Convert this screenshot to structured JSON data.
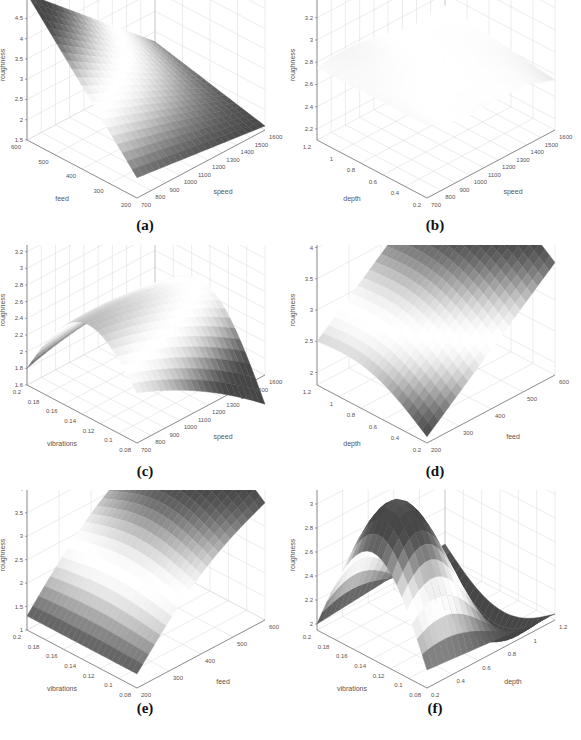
{
  "chart_data": [
    {
      "id": "a",
      "type": "surface3d",
      "caption": "(a)",
      "xlabel": "speed",
      "ylabel": "feed",
      "zlabel": "roughness",
      "x_ticks": [
        "700",
        "800",
        "900",
        "1000",
        "1100",
        "1200",
        "1300",
        "1400",
        "1500",
        "1600"
      ],
      "y_ticks": [
        "200",
        "300",
        "400",
        "500",
        "600"
      ],
      "z_ticks": [
        "1.5",
        "2",
        "2.5",
        "3",
        "3.5",
        "4",
        "4.5",
        "5"
      ],
      "xlim": [
        700,
        1600
      ],
      "ylim": [
        200,
        600
      ],
      "zlim": [
        1.5,
        5.2
      ],
      "grid": true,
      "surface_description": "Monotonic plane-like surface; max ~5.1 at speed 700/feed 600, min ~1.6 at speed 1600/feed 200",
      "corner_values": {
        "x_min_y_min": 2.0,
        "x_max_y_min": 1.6,
        "x_min_y_max": 5.1,
        "x_max_y_max": 2.6
      }
    },
    {
      "id": "b",
      "type": "surface3d",
      "caption": "(b)",
      "xlabel": "speed",
      "ylabel": "depth",
      "zlabel": "roughness",
      "x_ticks": [
        "700",
        "800",
        "900",
        "1000",
        "1100",
        "1200",
        "1300",
        "1400",
        "1500",
        "1600"
      ],
      "y_ticks": [
        "0.2",
        "0.4",
        "0.6",
        "0.8",
        "1",
        "1.2"
      ],
      "z_ticks": [
        "2.2",
        "2.4",
        "2.6",
        "2.8",
        "3",
        "3.2",
        "3.4"
      ],
      "xlim": [
        700,
        1600
      ],
      "ylim": [
        0.2,
        1.2
      ],
      "zlim": [
        2.1,
        3.45
      ],
      "grid": true,
      "surface_description": "Nearly flat, thin twisted surface around roughness 2.6–2.8",
      "corner_values": {
        "x_min_y_min": 2.75,
        "x_max_y_min": 2.55,
        "x_min_y_max": 2.75,
        "x_max_y_max": 2.7
      }
    },
    {
      "id": "c",
      "type": "surface3d",
      "caption": "(c)",
      "xlabel": "speed",
      "ylabel": "vibrations",
      "zlabel": "roughness",
      "x_ticks": [
        "700",
        "800",
        "900",
        "1000",
        "1100",
        "1200",
        "1300",
        "1400",
        "1500",
        "1600"
      ],
      "y_ticks": [
        "0.08",
        "0.1",
        "0.12",
        "0.14",
        "0.16",
        "0.18",
        "0.2"
      ],
      "z_ticks": [
        "1.6",
        "1.8",
        "2",
        "2.2",
        "2.4",
        "2.6",
        "2.8",
        "3",
        "3.2",
        "3.4"
      ],
      "xlim": [
        700,
        1600
      ],
      "ylim": [
        0.08,
        0.2
      ],
      "zlim": [
        1.6,
        3.4
      ],
      "grid": true,
      "surface_description": "Ridge along the vibrations direction peaking ~2.6 at mid vibrations; drops toward ~1.6 at high speed",
      "corner_values": {
        "x_min_y_min": 2.2,
        "x_max_y_min": 1.6,
        "x_min_y_max": 1.8,
        "x_max_y_max": 2.3
      }
    },
    {
      "id": "d",
      "type": "surface3d",
      "caption": "(d)",
      "xlabel": "feed",
      "ylabel": "depth",
      "zlabel": "roughness",
      "x_ticks": [
        "200",
        "300",
        "400",
        "500",
        "600"
      ],
      "y_ticks": [
        "0.2",
        "0.4",
        "0.6",
        "0.8",
        "1",
        "1.2"
      ],
      "z_ticks": [
        "2",
        "2.5",
        "3",
        "3.5",
        "4"
      ],
      "xlim": [
        200,
        600
      ],
      "ylim": [
        0.2,
        1.2
      ],
      "zlim": [
        1.8,
        4.2
      ],
      "grid": true,
      "surface_description": "Rises steadily with feed from ~1.9 to ~4.2; slight curvature along depth",
      "corner_values": {
        "x_min_y_min": 1.9,
        "x_max_y_min": 3.6,
        "x_min_y_max": 2.5,
        "x_max_y_max": 4.2
      }
    },
    {
      "id": "e",
      "type": "surface3d",
      "caption": "(e)",
      "xlabel": "feed",
      "ylabel": "vibrations",
      "zlabel": "roughness",
      "x_ticks": [
        "200",
        "300",
        "400",
        "500",
        "600"
      ],
      "y_ticks": [
        "0.08",
        "0.1",
        "0.12",
        "0.14",
        "0.16",
        "0.18",
        "0.2"
      ],
      "z_ticks": [
        "1",
        "1.5",
        "2",
        "2.5",
        "3",
        "3.5",
        "4"
      ],
      "xlim": [
        200,
        600
      ],
      "ylim": [
        0.08,
        0.2
      ],
      "zlim": [
        1,
        4.2
      ],
      "grid": true,
      "surface_description": "Saddle-like rise with feed; ~1.3 at low feed up to ~4.1 at high feed, mid vibrations",
      "corner_values": {
        "x_min_y_min": 1.3,
        "x_max_y_min": 3.5,
        "x_min_y_max": 1.3,
        "x_max_y_max": 3.6
      }
    },
    {
      "id": "f",
      "type": "surface3d",
      "caption": "(f)",
      "xlabel": "depth",
      "ylabel": "vibrations",
      "zlabel": "roughness",
      "x_ticks": [
        "0.2",
        "0.4",
        "0.6",
        "0.8",
        "1",
        "1.2"
      ],
      "y_ticks": [
        "0.08",
        "0.1",
        "0.12",
        "0.14",
        "0.16",
        "0.18",
        "0.2"
      ],
      "z_ticks": [
        "2",
        "2.2",
        "2.4",
        "2.6",
        "2.8",
        "3",
        "3.2"
      ],
      "xlim": [
        0.2,
        1.2
      ],
      "ylim": [
        0.08,
        0.2
      ],
      "zlim": [
        1.95,
        3.2
      ],
      "grid": true,
      "surface_description": "Twisted saddle surface; peaks ~2.9 near depth 1/vibrations 0.14 and ~2.8 near low depth, dips ~2.3 in the middle",
      "corner_values": {
        "x_min_y_min": 2.1,
        "x_max_y_min": 2.0,
        "x_min_y_max": 2.0,
        "x_max_y_max": 2.1
      }
    }
  ],
  "footer": {
    "caption_fragment": ""
  }
}
